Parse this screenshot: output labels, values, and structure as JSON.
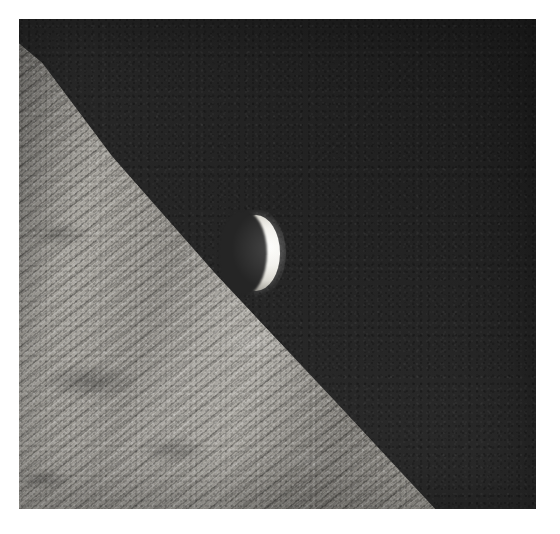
{
  "page": {
    "background_color": "#ffffff",
    "width": 560,
    "height": 534
  },
  "photo": {
    "name": "crescent-earthrise-photograph",
    "alt_text": "A crescent Earth rising above the rugged, sunlit limb of the Moon against black space",
    "border_color": "#ffffff",
    "border_width_px": 19,
    "frame": {
      "x": 19,
      "y": 19,
      "width": 517,
      "height": 490
    },
    "orientation": "landscape-square",
    "medium": "black and white photographic print"
  },
  "scene": {
    "sky": {
      "label": "deep space",
      "color": "#262626",
      "highlight_color": "#1d1d1d",
      "grain": "film grain"
    },
    "earth": {
      "label": "crescent Earth",
      "phase": "waning crescent",
      "lit_side": "right",
      "highlight_color": "#fdfdfb",
      "terminator_color": "#252525",
      "position": {
        "x": 232,
        "y": 215,
        "width": 48,
        "height": 76
      }
    },
    "moon": {
      "label": "lunar surface",
      "feature": "sunlit limb with diagonal ridges and craters",
      "light_color": "#b8b5ae",
      "mid_color": "#96938d",
      "shadow_color": "#6f6c66",
      "limb_direction": "upper-left to lower-right diagonal",
      "rim_highlight_color": "#ffffff"
    }
  }
}
